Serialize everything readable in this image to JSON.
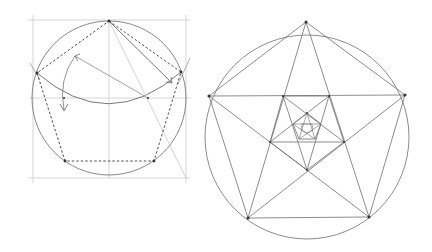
{
  "diagram": {
    "type": "geometric-construction",
    "colors": {
      "background": "#ffffff",
      "line": "#6e6e6e",
      "guide": "#b5b5b5",
      "dashed": "#3c3c3c",
      "vertex": "#333333"
    },
    "left_figure": {
      "description": "Construction of a regular pentagon inscribed in a circle",
      "frame": {
        "x1": 33,
        "y1": 20,
        "x2": 186,
        "y2": 178
      },
      "circle": {
        "cx": 109,
        "cy": 98,
        "r": 77
      },
      "vertices": [
        [
          109,
          21
        ],
        [
          181,
          72
        ],
        [
          154,
          161
        ],
        [
          65,
          161
        ],
        [
          37,
          73
        ]
      ],
      "construction_points": [
        [
          64,
          98
        ],
        [
          148,
          98
        ],
        [
          109,
          98
        ]
      ]
    },
    "right_figure": {
      "description": "Pentagon with inscribed pentagram and nested inner pentagons",
      "circle": {
        "cx": 307,
        "cy": 137,
        "r": 102
      },
      "outer_pentagon": [
        [
          306,
          22
        ],
        [
          405,
          95
        ],
        [
          369,
          217
        ],
        [
          248,
          218
        ],
        [
          209,
          96
        ]
      ],
      "inner_pentagon": [
        [
          283,
          96
        ],
        [
          329,
          96
        ],
        [
          344,
          142
        ],
        [
          307,
          170
        ],
        [
          270,
          142
        ]
      ],
      "inner_pentagon_2": [
        [
          307,
          113
        ],
        [
          314,
          127
        ],
        [
          300,
          127
        ],
        [
          296,
          117
        ],
        [
          318,
          117
        ]
      ]
    }
  }
}
